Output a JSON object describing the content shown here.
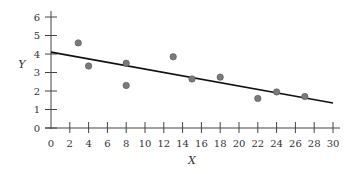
{
  "chart_data": {
    "type": "scatter",
    "title": "",
    "xlabel": "X",
    "ylabel": "Y",
    "xlim": [
      0,
      30
    ],
    "ylim": [
      0,
      6
    ],
    "x_ticks": [
      0,
      2,
      4,
      6,
      8,
      10,
      12,
      14,
      16,
      18,
      20,
      22,
      24,
      26,
      28,
      30
    ],
    "y_ticks": [
      0,
      1,
      2,
      3,
      4,
      5,
      6
    ],
    "grid": false,
    "legend": null,
    "series": [
      {
        "name": "observations",
        "type": "scatter",
        "points": [
          {
            "x": 2.9,
            "y": 4.6
          },
          {
            "x": 4,
            "y": 3.35
          },
          {
            "x": 8,
            "y": 3.5
          },
          {
            "x": 8,
            "y": 2.3
          },
          {
            "x": 13,
            "y": 3.85
          },
          {
            "x": 15,
            "y": 2.65
          },
          {
            "x": 18,
            "y": 2.75
          },
          {
            "x": 22,
            "y": 1.6
          },
          {
            "x": 24,
            "y": 1.95
          },
          {
            "x": 27,
            "y": 1.7
          }
        ],
        "color": "#7a7a7a"
      },
      {
        "name": "regression line",
        "type": "line",
        "points": [
          {
            "x": 0,
            "y": 4.1
          },
          {
            "x": 30,
            "y": 1.35
          }
        ],
        "color": "#111111"
      }
    ]
  },
  "axes": {
    "x_label": "X",
    "y_label": "Y"
  }
}
